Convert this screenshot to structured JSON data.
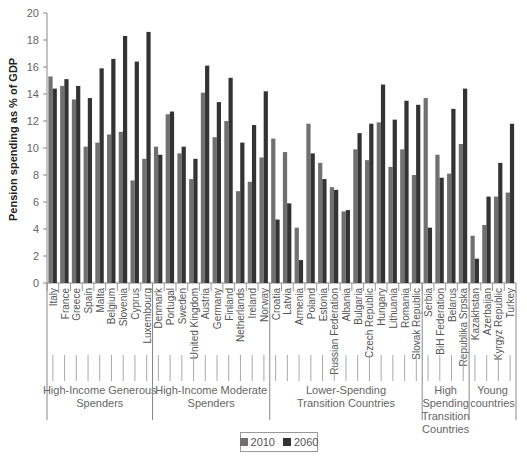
{
  "chart_data": {
    "type": "bar",
    "title": "",
    "xlabel": "",
    "ylabel": "Pension spending as % of GDP",
    "ylim": [
      0,
      20
    ],
    "yticks": [
      0,
      2,
      4,
      6,
      8,
      10,
      12,
      14,
      16,
      18,
      20
    ],
    "grid": false,
    "legend_position": "bottom",
    "categories": [
      "Italy",
      "France",
      "Greece",
      "Spain",
      "Malta",
      "Belgium",
      "Slovenia",
      "Cyprus",
      "Luxembourg",
      "Denmark",
      "Portugal",
      "Sweden",
      "United Kingdom",
      "Austria",
      "Germany",
      "Finland",
      "Netherlands",
      "Ireland",
      "Norway",
      "Croatia",
      "Latvia",
      "Armenia",
      "Poland",
      "Estonia",
      "Russian Federation",
      "Albania",
      "Bulgaria",
      "Czech Republic",
      "Hungary",
      "Lithuania",
      "Romania",
      "Slovak Republic",
      "Serbia",
      "BiH Federation",
      "Belarus",
      "Republika Srpska",
      "Kazakhstan",
      "Azerbaijan",
      "Kyrgyz Republic",
      "Turkey"
    ],
    "series": [
      {
        "name": "2010",
        "color": "#707070",
        "values": [
          15.3,
          14.6,
          13.6,
          10.1,
          10.4,
          11.0,
          11.2,
          7.6,
          9.2,
          10.1,
          12.5,
          9.6,
          7.7,
          14.1,
          10.8,
          12.0,
          6.8,
          7.5,
          9.3,
          10.7,
          9.7,
          4.1,
          11.8,
          8.9,
          7.1,
          5.3,
          9.9,
          9.1,
          11.9,
          8.6,
          9.9,
          8.0,
          13.7,
          9.5,
          8.1,
          10.3,
          3.5,
          4.3,
          6.4,
          6.7
        ]
      },
      {
        "name": "2060",
        "color": "#333333",
        "values": [
          14.4,
          15.1,
          14.6,
          13.7,
          15.9,
          16.6,
          18.3,
          16.4,
          18.6,
          9.5,
          12.7,
          10.1,
          9.2,
          16.1,
          13.4,
          15.2,
          10.4,
          11.7,
          14.2,
          4.7,
          5.9,
          1.7,
          9.6,
          7.7,
          6.9,
          5.4,
          11.1,
          11.8,
          14.7,
          12.1,
          13.5,
          13.2,
          4.1,
          7.8,
          12.9,
          14.4,
          1.8,
          6.4,
          8.9,
          11.8
        ]
      }
    ],
    "groups": [
      {
        "label": "High-Income Generous Spenders",
        "lines": [
          "High-Income Generous",
          "Spenders"
        ],
        "start": 0,
        "end": 8
      },
      {
        "label": "High-Income Moderate Spenders",
        "lines": [
          "High-Income Moderate",
          "Spenders"
        ],
        "start": 9,
        "end": 18
      },
      {
        "label": "Lower-Spending Transition Countries",
        "lines": [
          "Lower-Spending",
          "Transition Countries"
        ],
        "start": 19,
        "end": 31
      },
      {
        "label": "High Spending Transition Countries",
        "lines": [
          "High",
          "Spending",
          "Transition",
          "Countries"
        ],
        "start": 32,
        "end": 35
      },
      {
        "label": "Young countries",
        "lines": [
          "Young",
          "countries"
        ],
        "start": 36,
        "end": 39
      }
    ]
  },
  "legend": {
    "items": [
      {
        "label": "2010",
        "color": "#707070"
      },
      {
        "label": "2060",
        "color": "#333333"
      }
    ]
  }
}
